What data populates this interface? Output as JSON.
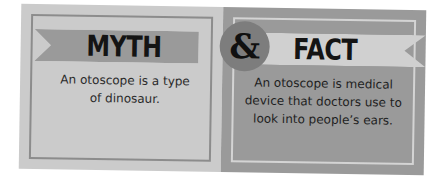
{
  "myth": {
    "heading": "MYTH",
    "text": "An otoscope is a type of dinosaur."
  },
  "connector": {
    "symbol": "&"
  },
  "fact": {
    "heading": "FACT",
    "text": "An otoscope is medical device that doctors use to look into people’s ears."
  },
  "colors": {
    "myth_panel": "#cbcbcb",
    "fact_panel": "#9a9a9a",
    "myth_ribbon": "#9a9a9a",
    "fact_ribbon": "#d0d0d0",
    "badge": "#7d7d7d",
    "text": "#141414"
  }
}
